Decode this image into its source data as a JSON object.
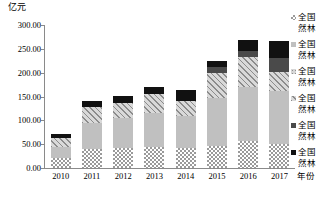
{
  "chart_data": {
    "type": "bar",
    "stacked": true,
    "title": "",
    "subtitle": "",
    "xlabel": "年份",
    "ylabel": "亿元",
    "ylim": [
      0,
      300
    ],
    "ytick_labels": [
      "0.00",
      "50.00",
      "100.00",
      "150.00",
      "200.00",
      "250.00",
      "300.00"
    ],
    "ytick_values": [
      0,
      50,
      100,
      150,
      200,
      250,
      300
    ],
    "grid": false,
    "legend_position": "right",
    "categories": [
      "2010",
      "2011",
      "2012",
      "2013",
      "2014",
      "2015",
      "2016",
      "2017"
    ],
    "series": [
      {
        "name": "全国天然林",
        "legend_line1": "全国",
        "legend_line2": "然林",
        "pattern": "checkerboard",
        "color": "#9a9a9a",
        "values": [
          22,
          40,
          43,
          44,
          42,
          47,
          56,
          50
        ]
      },
      {
        "name": "全国天然林",
        "legend_line1": "全国",
        "legend_line2": "然林",
        "pattern": "light-gray",
        "color": "#c0c0c0",
        "values": [
          22,
          54,
          62,
          71,
          68,
          100,
          115,
          112
        ]
      },
      {
        "name": "全国天然林",
        "legend_line1": "全国",
        "legend_line2": "然林",
        "pattern": "speckle",
        "color": "#d6d6d6",
        "values": [
          0,
          0,
          0,
          0,
          0,
          0,
          0,
          0
        ]
      },
      {
        "name": "全国天然林",
        "legend_line1": "全国",
        "legend_line2": "然林",
        "pattern": "diagonal-hatch",
        "color": "#8c8c8c",
        "values": [
          18,
          33,
          31,
          40,
          30,
          52,
          62,
          40
        ]
      },
      {
        "name": "全国天然林",
        "legend_line1": "全国",
        "legend_line2": "然林",
        "pattern": "dark-gray",
        "color": "#4a4a4a",
        "values": [
          0,
          0,
          0,
          0,
          0,
          12,
          12,
          29
        ]
      },
      {
        "name": "全国天然林",
        "legend_line1": "全国",
        "legend_line2": "然林",
        "pattern": "black",
        "color": "#111111",
        "values": [
          10,
          13,
          16,
          15,
          23,
          14,
          23,
          35
        ]
      }
    ],
    "totals": [
      72,
      140,
      152,
      170,
      163,
      225,
      268,
      266
    ]
  },
  "legend": {
    "items": [
      {
        "line1": "全国",
        "line2": "然林"
      },
      {
        "line1": "全国",
        "line2": "然林"
      },
      {
        "line1": "全国",
        "line2": "然林"
      },
      {
        "line1": "全国",
        "line2": "然林"
      },
      {
        "line1": "全国",
        "line2": "然林"
      },
      {
        "line1": "全国",
        "line2": "然林"
      }
    ]
  }
}
